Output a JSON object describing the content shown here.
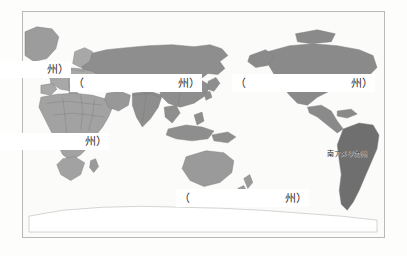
{
  "worksheet": {
    "type": "world-map-continent-fill-in",
    "frame": {
      "border_color": "#b9b9b7",
      "background_color": "#fbfbfa"
    }
  },
  "map": {
    "ocean_color": "#fbfbfa",
    "outline_color": "#8d8d8b",
    "land_tones": {
      "asia": "#8e8e8e",
      "europe": "#a8a8a8",
      "africa": "#a2a2a2",
      "north_america": "#8a8a8a",
      "south_america": "#6f6f6f",
      "oceania": "#9a9a9a",
      "antarctica": "#ffffff",
      "greenland": "#9c9c9c"
    }
  },
  "labels": {
    "paren_open": "（",
    "suffix": "州）",
    "blanks": [
      {
        "id": "europe",
        "name": "blank-europe",
        "paren_open": "",
        "suffix": "州）"
      },
      {
        "id": "asia",
        "name": "blank-asia",
        "paren_open": "（",
        "suffix": "州）"
      },
      {
        "id": "north_america",
        "name": "blank-north-america",
        "paren_open": "（",
        "suffix": "州）"
      },
      {
        "id": "africa",
        "name": "blank-africa",
        "paren_open": "",
        "suffix": "州）"
      },
      {
        "id": "oceania",
        "name": "blank-oceania",
        "paren_open": "（",
        "suffix": "州）"
      }
    ],
    "filled": [
      {
        "id": "south_america",
        "name": "label-south-america",
        "text": "南アメリカ州"
      }
    ]
  }
}
